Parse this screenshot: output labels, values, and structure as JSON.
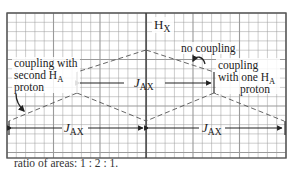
{
  "figure": {
    "grid_color": "#9a9a9a",
    "line_color": "#222222",
    "dash_color": "#555555",
    "labels": {
      "hx_main": "H",
      "hx_sub": "X",
      "no_coupling": "no coupling",
      "coupling_one_line1": "coupling",
      "coupling_one_line2_main": "with one H",
      "coupling_one_line2_sub": "A",
      "coupling_one_line3": "proton",
      "coupling_second_line1": "coupling with",
      "coupling_second_line2_main": "second H",
      "coupling_second_line2_sub": "A",
      "coupling_second_line3": "proton",
      "j_top_main": "J",
      "j_top_sub": "AX",
      "j_left_main": "J",
      "j_left_sub": "AX",
      "j_right_main": "J",
      "j_right_sub": "AX"
    },
    "peak_ratio": [
      1,
      2,
      1
    ]
  },
  "caption": "ratio of areas: 1 : 2 : 1."
}
